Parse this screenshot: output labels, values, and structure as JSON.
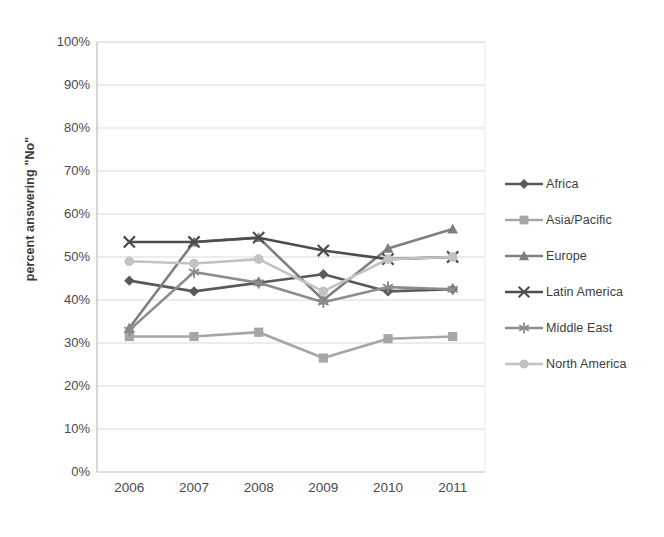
{
  "chart_data": {
    "type": "line",
    "title": "",
    "xlabel": "",
    "ylabel": "percent answering \"No\"",
    "categories": [
      "2006",
      "2007",
      "2008",
      "2009",
      "2010",
      "2011"
    ],
    "x_tick_labels": [
      "2006",
      "2007",
      "2008",
      "2009",
      "2010",
      "2011"
    ],
    "y_tick_labels": [
      "100%",
      "90%",
      "80%",
      "70%",
      "60%",
      "50%",
      "40%",
      "30%",
      "20%",
      "10%",
      "0%"
    ],
    "y_tick_values": [
      100,
      90,
      80,
      70,
      60,
      50,
      40,
      30,
      20,
      10,
      0
    ],
    "ylim": [
      0,
      100
    ],
    "y_unit": "%",
    "grid": "horizontal",
    "legend_position": "right",
    "series": [
      {
        "name": "Africa",
        "marker": "diamond",
        "color": "#595959",
        "values": [
          44.5,
          42.0,
          44.0,
          46.0,
          42.0,
          42.5
        ]
      },
      {
        "name": "Asia/Pacific",
        "marker": "square",
        "color": "#a6a6a6",
        "values": [
          31.5,
          31.5,
          32.5,
          26.5,
          31.0,
          31.5
        ]
      },
      {
        "name": "Europe",
        "marker": "triangle",
        "color": "#7f7f7f",
        "values": [
          33.5,
          53.5,
          54.5,
          40.0,
          52.0,
          56.5
        ]
      },
      {
        "name": "Latin America",
        "marker": "cross",
        "color": "#4d4d4d",
        "values": [
          53.5,
          53.5,
          54.5,
          51.5,
          49.5,
          50.0
        ]
      },
      {
        "name": "Middle East",
        "marker": "star",
        "color": "#8c8c8c",
        "values": [
          33.0,
          46.5,
          44.0,
          39.5,
          43.0,
          42.5
        ]
      },
      {
        "name": "North America",
        "marker": "circle",
        "color": "#c2c2c2",
        "values": [
          49.0,
          48.5,
          49.5,
          42.0,
          49.5,
          50.0
        ]
      }
    ]
  },
  "legend": {
    "items": [
      {
        "label": "Africa"
      },
      {
        "label": "Asia/Pacific"
      },
      {
        "label": "Europe"
      },
      {
        "label": "Latin America"
      },
      {
        "label": "Middle East"
      },
      {
        "label": "North America"
      }
    ]
  }
}
